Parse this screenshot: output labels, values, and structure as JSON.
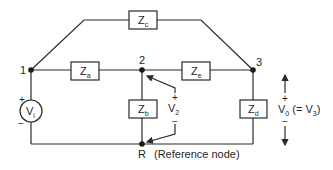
{
  "diagram": {
    "type": "circuit",
    "nodes": {
      "n1": "1",
      "n2": "2",
      "n3": "3",
      "ref": "R",
      "ref_note": "(Reference node)"
    },
    "impedances": {
      "za": {
        "base": "Z",
        "sub": "a"
      },
      "zb": {
        "base": "Z",
        "sub": "b"
      },
      "zc": {
        "base": "Z",
        "sub": "c"
      },
      "zd": {
        "base": "Z",
        "sub": "d"
      },
      "ze": {
        "base": "Z",
        "sub": "e"
      }
    },
    "source": {
      "base": "V",
      "sub": "i",
      "plus": "+",
      "minus": "−"
    },
    "v2": {
      "base": "V",
      "sub": "2",
      "plus": "+",
      "minus": "−"
    },
    "vo": {
      "base": "V",
      "sub": "0",
      "rest": " (= V",
      "sub2": "3",
      "close": ")",
      "plus": "+",
      "minus": "−"
    },
    "colors": {
      "line": "#2a2a2a",
      "text": "#1f1f1f"
    }
  }
}
